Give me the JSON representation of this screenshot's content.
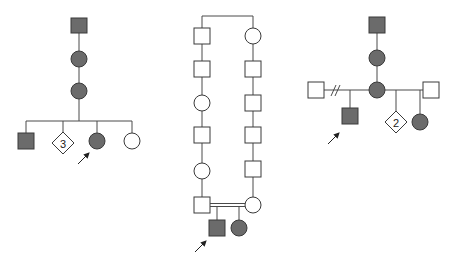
{
  "figure": {
    "colors": {
      "affected_fill": "#6b6b6b",
      "unaffected_fill": "#ffffff",
      "stroke": "#3a3a3a",
      "line": "#4a4a4a"
    }
  },
  "pedigrees": [
    {
      "id": "pedigree-a",
      "individuals": [
        {
          "sex": "male",
          "affected": true,
          "generation": 1
        },
        {
          "sex": "female",
          "affected": true,
          "generation": 2
        },
        {
          "sex": "female",
          "affected": true,
          "generation": 3
        },
        {
          "sex": "male",
          "affected": true,
          "generation": 4
        },
        {
          "sex": "unknown",
          "affected": false,
          "generation": 4,
          "count_label": "3"
        },
        {
          "sex": "female",
          "affected": true,
          "generation": 4,
          "proband": true
        },
        {
          "sex": "female",
          "affected": false,
          "generation": 4
        }
      ],
      "labels": {
        "diamond_count": "3"
      }
    },
    {
      "id": "pedigree-b",
      "description": "Consanguineous marriage after multiple generations from common ancestors",
      "left_line": [
        "male",
        "male",
        "female",
        "male",
        "female",
        "male"
      ],
      "right_line": [
        "female",
        "male",
        "male",
        "male",
        "male",
        "female"
      ],
      "children": [
        {
          "sex": "male",
          "affected": true,
          "proband": true
        },
        {
          "sex": "female",
          "affected": true
        }
      ]
    },
    {
      "id": "pedigree-c",
      "individuals": [
        {
          "sex": "male",
          "affected": true,
          "generation": 1
        },
        {
          "sex": "female",
          "affected": true,
          "generation": 2
        },
        {
          "sex": "female",
          "affected": true,
          "generation": 3
        },
        {
          "sex": "male",
          "affected": false,
          "generation": 3,
          "relationship": "divorced partner"
        },
        {
          "sex": "male",
          "affected": false,
          "generation": 3,
          "relationship": "partner"
        },
        {
          "sex": "male",
          "affected": true,
          "generation": 4,
          "proband": true
        },
        {
          "sex": "unknown",
          "affected": false,
          "generation": 4,
          "count_label": "2"
        },
        {
          "sex": "female",
          "affected": true,
          "generation": 4
        }
      ],
      "labels": {
        "diamond_count": "2"
      }
    }
  ]
}
